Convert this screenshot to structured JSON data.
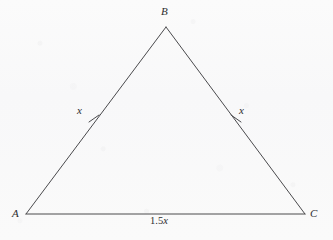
{
  "figure": {
    "type": "isosceles-triangle-diagram",
    "background_color": "#fafafa",
    "stroke_color": "#4a4a4d",
    "text_color": "#2d2d2f",
    "vertices": {
      "A": {
        "label": "A",
        "x": 26,
        "y": 214
      },
      "B": {
        "label": "B",
        "x": 166,
        "y": 27
      },
      "C": {
        "label": "C",
        "x": 305,
        "y": 214
      }
    },
    "side_labels": {
      "left": "x",
      "right": "x"
    },
    "base_label": {
      "number": "1.5",
      "variable": "x",
      "full": "1.5x"
    },
    "tick_marks": [
      {
        "side": "AB",
        "count": 1,
        "x": 94,
        "y": 119
      },
      {
        "side": "BC",
        "count": 1,
        "x": 236,
        "y": 119
      }
    ]
  }
}
